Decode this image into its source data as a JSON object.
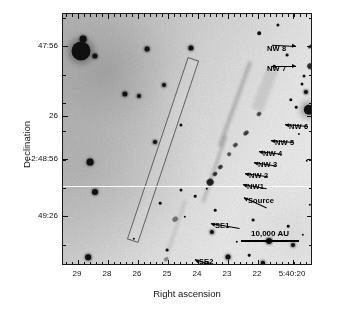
{
  "figure": {
    "type": "astronomical-image",
    "background_color": "#d8d8d8",
    "frame_color": "#1a1a1a"
  },
  "axes": {
    "x": {
      "label": "Right ascension",
      "tick_labels": [
        "29",
        "28",
        "26",
        "25",
        "24",
        "23",
        "22",
        "5:40:20"
      ],
      "tick_positions_pct": [
        6.0,
        18.0,
        30.0,
        42.0,
        54.0,
        66.0,
        78.0,
        92.0
      ],
      "minor_ticks_per_interval": 5,
      "direction": "decreasing-right"
    },
    "y": {
      "label": "Declination",
      "tick_labels": [
        "47:56",
        "26",
        "-2:48:56",
        "49:26"
      ],
      "tick_positions_pct": [
        12.7,
        40.5,
        57.5,
        80.2
      ]
    }
  },
  "annotations": [
    {
      "name": "NW 8",
      "label": "NW 8",
      "text_x": 204,
      "text_y": 30,
      "arrow_x": 233,
      "arrow_y": 32,
      "arrow_len": 24,
      "arrow_angle": 3
    },
    {
      "name": "NW 7",
      "label": "NW 7",
      "text_x": 204,
      "text_y": 50,
      "arrow_x": 233,
      "arrow_y": 52,
      "arrow_len": 24,
      "arrow_angle": 0
    },
    {
      "name": "NW 6",
      "label": "NW 6",
      "text_x": 226,
      "text_y": 108,
      "arrow_x": 222,
      "arrow_y": 110,
      "arrow_len": 23,
      "arrow_angle": 185
    },
    {
      "name": "NW 5",
      "label": "NW 5",
      "text_x": 212,
      "text_y": 124,
      "arrow_x": 208,
      "arrow_y": 126,
      "arrow_len": 22,
      "arrow_angle": 185
    },
    {
      "name": "NW 4",
      "label": "NW 4",
      "text_x": 200,
      "text_y": 135,
      "arrow_x": 196,
      "arrow_y": 137,
      "arrow_len": 22,
      "arrow_angle": 187
    },
    {
      "name": "NW 3",
      "label": "NW 3",
      "text_x": 195,
      "text_y": 146,
      "arrow_x": 191,
      "arrow_y": 148,
      "arrow_len": 22,
      "arrow_angle": 189
    },
    {
      "name": "NW 2",
      "label": "NW 2",
      "text_x": 186,
      "text_y": 157,
      "arrow_x": 182,
      "arrow_y": 159,
      "arrow_len": 23,
      "arrow_angle": 188
    },
    {
      "name": "NW1",
      "label": "NW1",
      "text_x": 184,
      "text_y": 168,
      "arrow_x": 180,
      "arrow_y": 170,
      "arrow_len": 24,
      "arrow_angle": 190
    },
    {
      "name": "Source",
      "label": "Source",
      "text_x": 185,
      "text_y": 182,
      "arrow_x": 181,
      "arrow_y": 183,
      "arrow_len": 25,
      "arrow_angle": 205
    },
    {
      "name": "SE1",
      "label": "SE1",
      "text_x": 152,
      "text_y": 207,
      "arrow_x": 148,
      "arrow_y": 209,
      "arrow_len": 29,
      "arrow_angle": 190
    },
    {
      "name": "SE2",
      "label": "SE2",
      "text_x": 136,
      "text_y": 243,
      "arrow_x": 132,
      "arrow_y": 245,
      "arrow_len": 25,
      "arrow_angle": 200
    }
  ],
  "scale_bar": {
    "label": "10,000 AU",
    "length_px": 58
  },
  "knots": [
    {
      "name": "NW8",
      "x": 248,
      "y": 32,
      "w": 7,
      "h": 3.2,
      "op": 0.85
    },
    {
      "name": "NW7",
      "x": 247,
      "y": 52,
      "w": 6,
      "h": 5.5,
      "op": 0.92
    },
    {
      "name": "NW6",
      "x": 196,
      "y": 100,
      "w": 5,
      "h": 4,
      "op": 0.8
    },
    {
      "name": "NW5",
      "x": 183,
      "y": 119,
      "w": 6,
      "h": 4,
      "op": 0.85
    },
    {
      "name": "NW4",
      "x": 172,
      "y": 131,
      "w": 4.5,
      "h": 3.5,
      "op": 0.8
    },
    {
      "name": "NW3",
      "x": 166,
      "y": 140,
      "w": 4,
      "h": 3.5,
      "op": 0.75
    },
    {
      "name": "NW2",
      "x": 157,
      "y": 153,
      "w": 4.5,
      "h": 3.5,
      "op": 0.88
    },
    {
      "name": "NW1",
      "x": 152,
      "y": 160,
      "w": 5,
      "h": 4,
      "op": 0.92
    },
    {
      "name": "Source",
      "x": 147,
      "y": 168,
      "w": 7,
      "h": 6.5,
      "op": 1.0
    },
    {
      "name": "SE1",
      "x": 112,
      "y": 205,
      "w": 6,
      "h": 4.5,
      "op": 0.55
    },
    {
      "name": "SE2",
      "x": 103,
      "y": 245,
      "w": 5,
      "h": 3.5,
      "op": 0.45
    }
  ],
  "stars": [
    {
      "x": 18,
      "y": 37,
      "r": 9.5,
      "cls": "halo"
    },
    {
      "x": 20,
      "y": 25,
      "r": 3.4,
      "cls": "soft"
    },
    {
      "x": 32,
      "y": 42,
      "r": 2.6,
      "cls": "soft"
    },
    {
      "x": 84,
      "y": 35,
      "r": 2.4,
      "cls": "soft"
    },
    {
      "x": 128,
      "y": 34,
      "r": 2.6,
      "cls": "soft"
    },
    {
      "x": 196,
      "y": 19,
      "r": 1.8,
      "cls": ""
    },
    {
      "x": 215,
      "y": 11,
      "r": 1.6,
      "cls": ""
    },
    {
      "x": 228,
      "y": 86,
      "r": 1.7,
      "cls": ""
    },
    {
      "x": 233,
      "y": 93,
      "r": 1.3,
      "cls": ""
    },
    {
      "x": 239,
      "y": 70,
      "r": 1.5,
      "cls": ""
    },
    {
      "x": 224,
      "y": 41,
      "r": 1.4,
      "cls": ""
    },
    {
      "x": 211,
      "y": 52,
      "r": 1.3,
      "cls": ""
    },
    {
      "x": 265,
      "y": 45,
      "r": 4.6,
      "cls": "halo"
    },
    {
      "x": 241,
      "y": 62,
      "r": 1.5,
      "cls": ""
    },
    {
      "x": 243,
      "y": 78,
      "r": 2.1,
      "cls": "soft"
    },
    {
      "x": 246,
      "y": 96,
      "r": 5.2,
      "cls": "halo"
    },
    {
      "x": 62,
      "y": 80,
      "r": 2.6,
      "cls": "soft"
    },
    {
      "x": 76,
      "y": 82,
      "r": 2.0,
      "cls": "soft"
    },
    {
      "x": 101,
      "y": 71,
      "r": 2.0,
      "cls": "soft"
    },
    {
      "x": 92,
      "y": 128,
      "r": 2.0,
      "cls": "soft"
    },
    {
      "x": 118,
      "y": 111,
      "r": 1.6,
      "cls": ""
    },
    {
      "x": 27,
      "y": 148,
      "r": 3.4,
      "cls": "soft"
    },
    {
      "x": 32,
      "y": 178,
      "r": 3.0,
      "cls": "soft"
    },
    {
      "x": 118,
      "y": 176,
      "r": 1.5,
      "cls": ""
    },
    {
      "x": 132,
      "y": 182,
      "r": 1.3,
      "cls": ""
    },
    {
      "x": 122,
      "y": 203,
      "r": 1.2,
      "cls": ""
    },
    {
      "x": 152,
      "y": 196,
      "r": 1.3,
      "cls": ""
    },
    {
      "x": 144,
      "y": 175,
      "r": 1.2,
      "cls": ""
    },
    {
      "x": 149,
      "y": 218,
      "r": 2.1,
      "cls": "soft"
    },
    {
      "x": 225,
      "y": 212,
      "r": 1.3,
      "cls": ""
    },
    {
      "x": 240,
      "y": 221,
      "r": 1.2,
      "cls": ""
    },
    {
      "x": 206,
      "y": 227,
      "r": 3.0,
      "cls": "soft"
    },
    {
      "x": 230,
      "y": 231,
      "r": 2.0,
      "cls": "soft"
    },
    {
      "x": 190,
      "y": 206,
      "r": 1.4,
      "cls": ""
    },
    {
      "x": 165,
      "y": 243,
      "r": 2.5,
      "cls": "soft"
    },
    {
      "x": 145,
      "y": 249,
      "r": 1.4,
      "cls": ""
    },
    {
      "x": 200,
      "y": 249,
      "r": 2.2,
      "cls": "soft"
    },
    {
      "x": 104,
      "y": 236,
      "r": 1.4,
      "cls": ""
    },
    {
      "x": 25,
      "y": 243,
      "r": 2.8,
      "cls": "soft"
    },
    {
      "x": 58,
      "y": 252,
      "r": 1.4,
      "cls": ""
    },
    {
      "x": 186,
      "y": 241,
      "r": 1.3,
      "cls": ""
    },
    {
      "x": 249,
      "y": 180,
      "r": 1.1,
      "cls": ""
    },
    {
      "x": 247,
      "y": 191,
      "r": 1.2,
      "cls": ""
    },
    {
      "x": 244,
      "y": 147,
      "r": 1.2,
      "cls": ""
    },
    {
      "x": 236,
      "y": 120,
      "r": 1.1,
      "cls": ""
    },
    {
      "x": 174,
      "y": 228,
      "r": 1.2,
      "cls": ""
    },
    {
      "x": 97,
      "y": 189,
      "r": 1.3,
      "cls": ""
    },
    {
      "x": 71,
      "y": 225,
      "r": 1.2,
      "cls": ""
    }
  ]
}
